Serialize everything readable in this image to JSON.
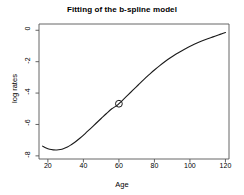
{
  "chart_data": {
    "type": "line",
    "title": "Fitting of the b-spline model",
    "xlabel": "Age",
    "ylabel": "log rates",
    "xlim": [
      15,
      122
    ],
    "ylim": [
      -8.2,
      0.4
    ],
    "xticks": [
      20,
      40,
      60,
      80,
      100,
      120
    ],
    "yticks": [
      0,
      -2,
      -4,
      -6,
      -8
    ],
    "grid": false,
    "legend": null,
    "series": [
      {
        "name": "b-spline fit",
        "color": "#1a1a1a",
        "x": [
          17,
          19,
          21,
          23,
          25,
          27,
          29,
          31,
          33,
          35,
          38,
          41,
          44,
          47,
          50,
          53,
          56,
          59,
          62,
          65,
          68,
          71,
          74,
          77,
          80,
          83,
          86,
          89,
          92,
          95,
          98,
          101,
          104,
          107,
          110,
          113,
          116,
          118,
          120
        ],
        "y": [
          -7.38,
          -7.5,
          -7.58,
          -7.62,
          -7.63,
          -7.6,
          -7.53,
          -7.43,
          -7.3,
          -7.15,
          -6.88,
          -6.58,
          -6.26,
          -5.94,
          -5.62,
          -5.3,
          -5.0,
          -4.78,
          -4.46,
          -4.13,
          -3.8,
          -3.47,
          -3.14,
          -2.83,
          -2.53,
          -2.25,
          -1.99,
          -1.75,
          -1.53,
          -1.33,
          -1.14,
          -0.97,
          -0.81,
          -0.67,
          -0.54,
          -0.42,
          -0.3,
          -0.22,
          -0.14
        ]
      }
    ],
    "markers": [
      {
        "name": "highlighted-point",
        "shape": "open-circle",
        "x": 60,
        "y": -4.68,
        "color": "#1a1a1a"
      }
    ]
  },
  "labels": {
    "xticks": [
      "20",
      "40",
      "60",
      "80",
      "100",
      "120"
    ],
    "yticks": [
      "0",
      "-2",
      "-4",
      "-6",
      "-8"
    ]
  }
}
